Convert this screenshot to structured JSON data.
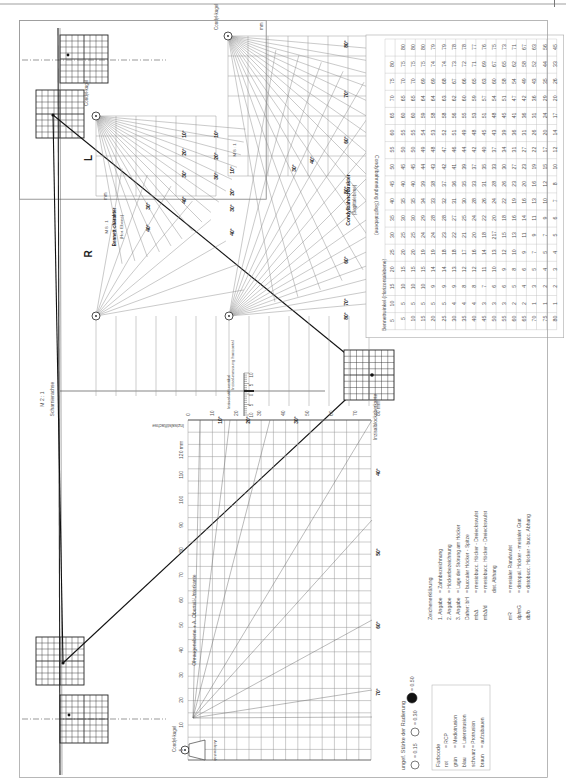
{
  "page": {
    "orientation": "rotated-90",
    "frame": {
      "x": 19,
      "y": 20,
      "w": 247,
      "h": 179
    }
  },
  "labels": {
    "scharnierachse": "Scharnierachse",
    "scale_m21": "M 2 : 1",
    "scale_m81": "M 8 : 1",
    "left_side": "L",
    "right_side": "R",
    "condyl_kugel": "Condyl-kugel",
    "bennett_charakter": "Bennett-charakter",
    "bennett_hor_ebene": "(Hor. Ebene)",
    "condylbahncharakter": "Condylbahncharakter",
    "condylbahncharakter_sub": "(Sagittalebene)",
    "mm": "mm",
    "horizontal_messung": "Horizontal-messung",
    "sag_vert_messung": "Sag.-/Vert.-Messung",
    "inzisal_stift_vertikal": "Inzisal-stift-vertikal",
    "inzisal_messung_horizontal": "Inzisal-messung horizontal",
    "inzisalstiftachse": "Inzisalstiftachse",
    "inzisalblockoberkante": "Inzisalblockoberkante",
    "ohraugenebene": "Ohraugenebene + A. Oberteil-Unterkante",
    "achsenstab": "Achsenstab",
    "scale_120mm": "120 mm",
    "scale_80mm": "80 mm"
  },
  "condyl_fan_angles": [
    "10°",
    "20°",
    "30°",
    "40°",
    "50°",
    "60°",
    "70°",
    "80°"
  ],
  "bennett_fan_angles": [
    "10°",
    "20°",
    "30°",
    "40°"
  ],
  "inzisal_scale": [
    "10",
    "5",
    "0",
    "5",
    "10"
  ],
  "grid_axis": {
    "ohraugen_ticks": [
      "5",
      "10",
      "20",
      "30",
      "40",
      "50",
      "60",
      "70",
      "80",
      "90",
      "100",
      "110",
      "120 mm"
    ],
    "stift_ticks": [
      "0",
      "10",
      "20",
      "30",
      "40",
      "50",
      "60",
      "70",
      "80 mm"
    ],
    "fan_angles": [
      "10°",
      "20°",
      "30°",
      "40°",
      "50°",
      "60°",
      "70°"
    ]
  },
  "radierung": {
    "title": "ungef. Stärke der Radierung",
    "sizes": [
      "= 0.15",
      "= 0.30",
      "= 0.50"
    ]
  },
  "farbcode": {
    "title": "Farbcode",
    "rows": [
      {
        "color": "rot",
        "meaning": "= RCP"
      },
      {
        "color": "grün",
        "meaning": "= Mediotrusion"
      },
      {
        "color": "blau",
        "meaning": "= Laterotrusion"
      },
      {
        "color": "schwarz",
        "meaning": "= Protrusion"
      },
      {
        "color": "braun",
        "meaning": "= aufzubauen"
      }
    ]
  },
  "zeichenerklaerung": {
    "title": "Zeichenerklärung",
    "rows": [
      {
        "key": "1. Angabe",
        "value": "= Zahnbezeichnung"
      },
      {
        "key": "2. Angabe",
        "value": "= Höckerbezeichnung"
      },
      {
        "key": "3. Angabe",
        "value": "= Lage der Störung am Höcker"
      },
      {
        "key": "Daher: bH",
        "value": "= buccaler Höcker - Spitze"
      },
      {
        "key": "mbΔ",
        "value": "= mesiobucc. Höcker - Dreieckswulst"
      },
      {
        "key": "mbΔ/d",
        "value": "= mesiobucc. Höcker - Dreieckswulst"
      },
      {
        "key": "",
        "value": "dist. Abhang"
      },
      {
        "key": "mR",
        "value": "= mesialer Randwulst"
      },
      {
        "key": "dp/mG",
        "value": "= distopal. Höcker - mesialer Grat"
      },
      {
        "key": "db/b",
        "value": "= distobucc. Höcker - bucc. Abhang"
      }
    ]
  },
  "table": {
    "title_cols": "Bennettwinkel (Horizontalebene)",
    "title_rows": "Condylbahnneigung (Sagittalebene)",
    "col_headers": [
      "5",
      "10",
      "15",
      "20",
      "25",
      "30",
      "35",
      "40",
      "45",
      "50",
      "55",
      "60",
      "65",
      "70",
      "75",
      "80"
    ],
    "row_headers": [
      "5",
      "10",
      "15",
      "20",
      "25",
      "30",
      "35",
      "40",
      "45",
      "50",
      "55",
      "60",
      "65",
      "70",
      "75",
      "80"
    ],
    "rows": [
      [
        "5",
        "10",
        "15",
        "20",
        "25",
        "30",
        "35",
        "40",
        "45",
        "50",
        "55",
        "60",
        "65",
        "70",
        "75",
        "80"
      ],
      [
        "5",
        "10",
        "15",
        "20",
        "25",
        "30",
        "35",
        "40",
        "45",
        "50",
        "55",
        "60",
        "65",
        "70",
        "75",
        "80"
      ],
      [
        "5",
        "10",
        "15",
        "20",
        "25",
        "30",
        "35",
        "40",
        "45",
        "50",
        "55",
        "60",
        "65",
        "70",
        "75",
        "80"
      ],
      [
        "5",
        "10",
        "15",
        "19",
        "24",
        "29",
        "34",
        "39",
        "44",
        "49",
        "54",
        "59",
        "64",
        "69",
        "75",
        "80"
      ],
      [
        "5",
        "9",
        "14",
        "19",
        "24",
        "28",
        "33",
        "38",
        "43",
        "48",
        "53",
        "58",
        "64",
        "69",
        "74",
        "79"
      ],
      [
        "5",
        "9",
        "14",
        "18",
        "23",
        "28",
        "32",
        "37",
        "42",
        "47",
        "52",
        "58",
        "63",
        "68",
        "74",
        "79"
      ],
      [
        "4",
        "9",
        "13",
        "18",
        "22",
        "27",
        "31",
        "36",
        "41",
        "46",
        "51",
        "56",
        "62",
        "67",
        "73",
        "78"
      ],
      [
        "4",
        "8",
        "12",
        "17",
        "21",
        "25",
        "30",
        "35",
        "39",
        "44",
        "49",
        "55",
        "60",
        "66",
        "72",
        "78"
      ],
      [
        "4",
        "8",
        "12",
        "16",
        "20",
        "24",
        "28",
        "33",
        "37",
        "42",
        "48",
        "53",
        "59",
        "65",
        "71",
        "77"
      ],
      [
        "3",
        "7",
        "11",
        "14",
        "18",
        "22",
        "26",
        "31",
        "35",
        "40",
        "45",
        "51",
        "57",
        "63",
        "69",
        "76"
      ],
      [
        "3",
        "6",
        "10",
        "13",
        "217",
        "20",
        "24",
        "28",
        "33",
        "37",
        "43",
        "48",
        "54",
        "60",
        "67",
        "75"
      ],
      [
        "3",
        "6",
        "9",
        "12",
        "15",
        "18",
        "22",
        "26",
        "30",
        "34",
        "39",
        "45",
        "51",
        "58",
        "65",
        "73"
      ],
      [
        "2",
        "5",
        "8",
        "10",
        "13",
        "16",
        "19",
        "23",
        "27",
        "31",
        "36",
        "41",
        "47",
        "54",
        "62",
        "71"
      ],
      [
        "2",
        "4",
        "6",
        "9",
        "11",
        "14",
        "16",
        "20",
        "23",
        "27",
        "31",
        "36",
        "42",
        "49",
        "58",
        "67"
      ],
      [
        "1",
        "3",
        "5",
        "7",
        "9",
        "11",
        "13",
        "16",
        "19",
        "22",
        "26",
        "31",
        "36",
        "43",
        "52",
        "63"
      ],
      [
        "1",
        "2",
        "4",
        "5",
        "7",
        "9",
        "10",
        "12",
        "15",
        "17",
        "20",
        "24",
        "29",
        "35",
        "44",
        "56"
      ],
      [
        "1",
        "2",
        "3",
        "4",
        "5",
        "6",
        "7",
        "8",
        "10",
        "12",
        "14",
        "17",
        "20",
        "26",
        "33",
        "45"
      ]
    ]
  }
}
